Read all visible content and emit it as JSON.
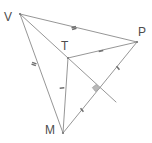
{
  "figure": {
    "canvas": {
      "width": 152,
      "height": 143,
      "background": "#ffffff"
    },
    "stroke_color": "#8a8a8a",
    "label_color": "#4d4d4d",
    "tick_color": "#6f6f6f",
    "right_angle_color": "#b9b9b9"
  },
  "vertices": [
    {
      "id": "V",
      "label": "V",
      "x": 20,
      "y": 14,
      "label_x": 4,
      "label_y": 11
    },
    {
      "id": "P",
      "label": "P",
      "x": 137,
      "y": 42,
      "label_x": 138,
      "label_y": 26
    },
    {
      "id": "T",
      "label": "T",
      "x": 68,
      "y": 58,
      "label_x": 61,
      "label_y": 40
    },
    {
      "id": "M",
      "label": "M",
      "x": 63,
      "y": 133,
      "label_x": 45,
      "label_y": 124
    }
  ],
  "segments": [
    {
      "id": "VP",
      "from": "V",
      "to": "P",
      "ticks": 2
    },
    {
      "id": "VM",
      "from": "V",
      "to": "M",
      "ticks": 2
    },
    {
      "id": "VT",
      "from": "V",
      "to": "T",
      "ticks": 0
    },
    {
      "id": "TP",
      "from": "T",
      "to": "P",
      "ticks": 1
    },
    {
      "id": "TM",
      "from": "T",
      "to": "M",
      "ticks": 1
    },
    {
      "id": "MP",
      "from": "M",
      "to": "P",
      "ticks": 1
    }
  ],
  "cevian": {
    "id": "T-foot",
    "from": "T",
    "through_x": 96,
    "through_y": 88,
    "end_x": 116,
    "end_y": 102,
    "right_angle_at": {
      "x": 96,
      "y": 88
    }
  },
  "tick_marks": [
    {
      "on": "VP",
      "x": 74,
      "y": 28,
      "count": 2,
      "angle": 73
    },
    {
      "on": "VM",
      "x": 34,
      "y": 64,
      "count": 2,
      "angle": -71
    },
    {
      "on": "TP",
      "x": 101,
      "y": 51,
      "count": 1,
      "angle": 78
    },
    {
      "on": "TM",
      "x": 62,
      "y": 88,
      "count": 1,
      "angle": 86
    },
    {
      "on": "MP",
      "x": 82,
      "y": 110,
      "count": 1,
      "angle": -39
    },
    {
      "on": "MP",
      "x": 118,
      "y": 68,
      "count": 1,
      "angle": -39
    }
  ]
}
